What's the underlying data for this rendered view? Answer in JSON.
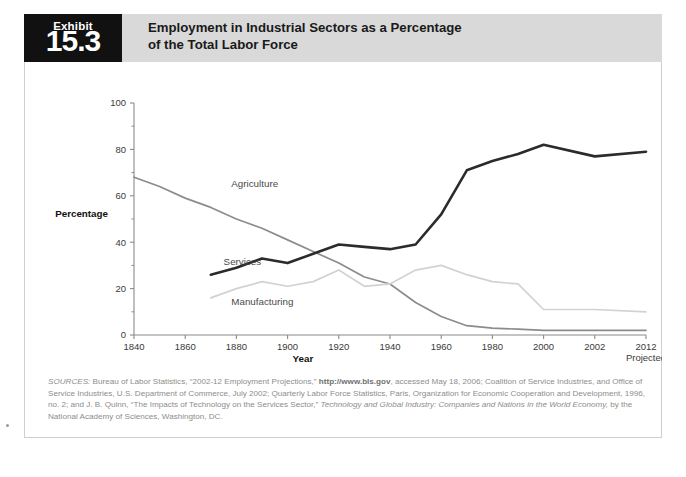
{
  "exhibit": {
    "label": "Exhibit",
    "number": "15.3"
  },
  "title": {
    "line1": "Employment in Industrial Sectors as a Percentage",
    "line2": "of the Total Labor Force"
  },
  "colors": {
    "services": "#2b2b2b",
    "agriculture": "#8c8c8c",
    "manufacturing": "#d2d2d2",
    "axis": "#8a8a8a",
    "header_band": "#d9d9d9",
    "exhibit_box": "#111111",
    "source_text": "#8d8d8d"
  },
  "chart_data": {
    "type": "line",
    "title": "Employment in Industrial Sectors as a Percentage of the Total Labor Force",
    "xlabel": "Year",
    "ylabel": "Percentage",
    "ylim": [
      0,
      100
    ],
    "yticks": [
      0,
      20,
      40,
      60,
      80,
      100
    ],
    "ytick_labels": [
      "0",
      "20",
      "40",
      "60",
      "80",
      "100"
    ],
    "y_minor_ticks": [
      10,
      30,
      50,
      70,
      90
    ],
    "xticks": [
      1840,
      1860,
      1880,
      1900,
      1920,
      1940,
      1960,
      1980,
      2000,
      2002,
      2012
    ],
    "xtick_labels": [
      "1840",
      "1860",
      "1880",
      "1900",
      "1920",
      "1940",
      "1960",
      "1980",
      "2000",
      "2002",
      "2012"
    ],
    "x_axis_note": "Projected",
    "grid": false,
    "legend_position": "inline-labels",
    "series": [
      {
        "name": "Agriculture",
        "color": "#8c8c8c",
        "label_x": 1878,
        "label_y": 64,
        "x": [
          1840,
          1850,
          1860,
          1870,
          1880,
          1890,
          1900,
          1910,
          1920,
          1930,
          1940,
          1950,
          1960,
          1970,
          1980,
          1990,
          2000,
          2002,
          2012
        ],
        "values": [
          68,
          64,
          59,
          55,
          50,
          46,
          41,
          36,
          31,
          25,
          22,
          14,
          8,
          4,
          3,
          2.5,
          2,
          2,
          2
        ]
      },
      {
        "name": "Services",
        "color": "#2b2b2b",
        "label_x": 1875,
        "label_y": 30,
        "x": [
          1870,
          1880,
          1890,
          1900,
          1910,
          1920,
          1930,
          1940,
          1950,
          1960,
          1970,
          1980,
          1990,
          2000,
          2002,
          2012
        ],
        "values": [
          26,
          29,
          33,
          31,
          35,
          39,
          38,
          37,
          39,
          52,
          71,
          75,
          78,
          82,
          77,
          79
        ]
      },
      {
        "name": "Manufacturing",
        "color": "#d2d2d2",
        "label_x": 1878,
        "label_y": 13,
        "x": [
          1870,
          1880,
          1890,
          1900,
          1910,
          1920,
          1930,
          1940,
          1950,
          1960,
          1970,
          1980,
          1990,
          2000,
          2002,
          2012
        ],
        "values": [
          16,
          20,
          23,
          21,
          23,
          28,
          21,
          22,
          28,
          30,
          26,
          23,
          22,
          11,
          11,
          10
        ]
      }
    ]
  },
  "source": {
    "lead": "SOURCES:",
    "part1": " Bureau of Labor Statistics, “2002-12 Employment Projections,” ",
    "url": "http://www.bls.gov",
    "part2": ", accessed May 18, 2006; Coalition of Service Industries, and Office of Service Industries, U.S. Department of Commerce, July 2002; Quarterly Labor Force Statistics, Paris, Organization for Economic Cooperation and Development, 1996, no. 2; and J. B. Quinn, “The Impacts of Technology on the Services Sector,” ",
    "italic_title": "Technology and Global Industry: Companies and Nations in the World Economy,",
    "part3": " by the National Academy of Sciences, Washington, DC."
  }
}
